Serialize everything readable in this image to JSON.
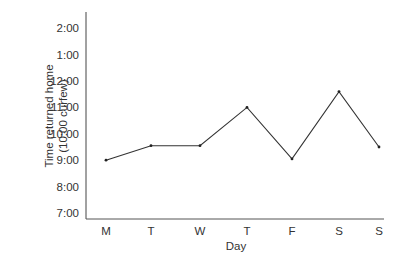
{
  "chart_data": {
    "type": "line",
    "title": "",
    "xlabel": "Day",
    "ylabel": "Time returned home",
    "ylabel_sub": "(10:00 curfew)",
    "categories": [
      "M",
      "T",
      "W",
      "T",
      "F",
      "S",
      "S"
    ],
    "y_ticks": [
      "7:00",
      "8:00",
      "9:00",
      "10:00",
      "11:00",
      "12:00",
      "1:00",
      "2:00"
    ],
    "y_tick_hours": [
      7,
      8,
      9,
      10,
      11,
      12,
      13,
      14
    ],
    "series": [
      {
        "name": "Return time",
        "values_label": [
          "9:00",
          "9:30",
          "9:30",
          "11:00",
          "9:00",
          "11:35",
          "9:30"
        ],
        "values": [
          9.0,
          9.55,
          9.55,
          11.0,
          9.05,
          11.6,
          9.5
        ]
      }
    ],
    "ylim": [
      6.8,
      15.0
    ],
    "grid": false,
    "legend": "none",
    "annotation": "10:00 curfew"
  }
}
